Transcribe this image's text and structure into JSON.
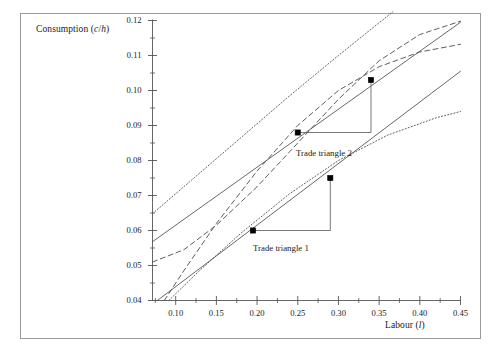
{
  "figure": {
    "frame": {
      "border_color": "#9a9a9a",
      "background": "#ffffff"
    },
    "axis_color": "#555555",
    "curve_color": "#4d4d4d",
    "marker_color": "#000000"
  },
  "axes": {
    "y_label_prefix": "Consumption (",
    "y_label_var1": "c",
    "y_label_slash": "/",
    "y_label_var2": "h",
    "y_label_suffix": ")",
    "y_label_full": "Consumption (c/h)",
    "x_label_prefix": "Labour (",
    "x_label_var": "l",
    "x_label_suffix": ")",
    "x_label_full": "Labour (l)",
    "y_ticks": [
      "0.12",
      "0.11",
      "0.10",
      "0.09",
      "0.08",
      "0.07",
      "0.06",
      "0.05",
      "0.04"
    ],
    "x_ticks": [
      "0.10",
      "0.15",
      "0.20",
      "0.25",
      "0.30",
      "0.35",
      "0.40",
      "0.45"
    ]
  },
  "annotations": {
    "trade_triangle_1": "Trade triangle 1",
    "trade_triangle_2": "Trade triangle 2"
  },
  "chart_data": {
    "type": "line",
    "title": "",
    "xlabel": "Labour (l)",
    "ylabel": "Consumption (c/h)",
    "xlim": [
      0.0715,
      0.45
    ],
    "ylim": [
      0.04,
      0.12
    ],
    "grid": false,
    "legend": "none",
    "x_tick_values": [
      0.1,
      0.15,
      0.2,
      0.25,
      0.3,
      0.35,
      0.4,
      0.45
    ],
    "y_tick_values": [
      0.04,
      0.05,
      0.06,
      0.07,
      0.08,
      0.09,
      0.1,
      0.11,
      0.12
    ],
    "x_minor_tick_step": 0.025,
    "y_minor_tick_step": 0.005,
    "series": [
      {
        "name": "budget-line-upper",
        "style": "solid",
        "points": [
          [
            0.0715,
            0.0568
          ],
          [
            0.45,
            0.1195
          ]
        ]
      },
      {
        "name": "budget-line-lower",
        "style": "solid",
        "points": [
          [
            0.0775,
            0.04
          ],
          [
            0.45,
            0.1055
          ]
        ]
      },
      {
        "name": "production-frontier-upper",
        "style": "dotted",
        "points": [
          [
            0.0715,
            0.0648
          ],
          [
            0.12,
            0.0745
          ],
          [
            0.18,
            0.0865
          ],
          [
            0.24,
            0.0985
          ],
          [
            0.3,
            0.11
          ],
          [
            0.34,
            0.1175
          ],
          [
            0.367,
            0.1225
          ]
        ]
      },
      {
        "name": "production-frontier-lower",
        "style": "dotted",
        "points": [
          [
            0.0915,
            0.04
          ],
          [
            0.13,
            0.0487
          ],
          [
            0.18,
            0.0592
          ],
          [
            0.24,
            0.0705
          ],
          [
            0.3,
            0.08
          ],
          [
            0.36,
            0.0872
          ],
          [
            0.42,
            0.0922
          ],
          [
            0.45,
            0.094
          ]
        ]
      },
      {
        "name": "indifference-curve-upper",
        "style": "dashed",
        "points": [
          [
            0.0715,
            0.051
          ],
          [
            0.11,
            0.0545
          ],
          [
            0.15,
            0.0615
          ],
          [
            0.2,
            0.0725
          ],
          [
            0.25,
            0.085
          ],
          [
            0.3,
            0.0975
          ],
          [
            0.35,
            0.1085
          ],
          [
            0.4,
            0.116
          ],
          [
            0.45,
            0.1198
          ]
        ]
      },
      {
        "name": "indifference-curve-lower",
        "style": "dashed",
        "points": [
          [
            0.086,
            0.04
          ],
          [
            0.11,
            0.0485
          ],
          [
            0.15,
            0.062
          ],
          [
            0.2,
            0.077
          ],
          [
            0.25,
            0.09
          ],
          [
            0.3,
            0.1
          ],
          [
            0.35,
            0.1068
          ],
          [
            0.4,
            0.111
          ],
          [
            0.45,
            0.1132
          ]
        ]
      }
    ],
    "markers": [
      {
        "name": "tt1-start",
        "x": 0.195,
        "y": 0.06
      },
      {
        "name": "tt1-end",
        "x": 0.29,
        "y": 0.075
      },
      {
        "name": "tt2-start",
        "x": 0.25,
        "y": 0.088
      },
      {
        "name": "tt2-end",
        "x": 0.34,
        "y": 0.103
      }
    ],
    "triangles": [
      {
        "name": "trade-triangle-1",
        "x0": 0.195,
        "y0": 0.06,
        "x1": 0.29,
        "y1": 0.075,
        "label": "Trade triangle 1"
      },
      {
        "name": "trade-triangle-2",
        "x0": 0.25,
        "y0": 0.088,
        "x1": 0.34,
        "y1": 0.103,
        "label": "Trade triangle 2"
      }
    ]
  }
}
